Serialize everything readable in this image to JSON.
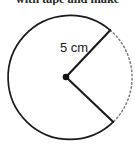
{
  "page": {
    "width": 135,
    "height": 145,
    "background_color": "#ffffff"
  },
  "heading": {
    "cropped_text": "with tape and make",
    "note": "partially cropped text line at very top edge"
  },
  "figure": {
    "name": "circle-with-cut-sector",
    "shape": "circle",
    "center": {
      "x": 66,
      "y": 77
    },
    "radius_px": 62,
    "stroke_color": "#1a1a1a",
    "dashed_stroke_color": "#7d7d7d",
    "center_dot_color": "#111111",
    "radius_label": "5 cm",
    "solid_arc_sweep_degrees": 280,
    "dashed_arc_sweep_degrees": 80,
    "endpoints": {
      "upper": {
        "x": 110,
        "y": 30
      },
      "lower": {
        "x": 113,
        "y": 122
      }
    }
  }
}
